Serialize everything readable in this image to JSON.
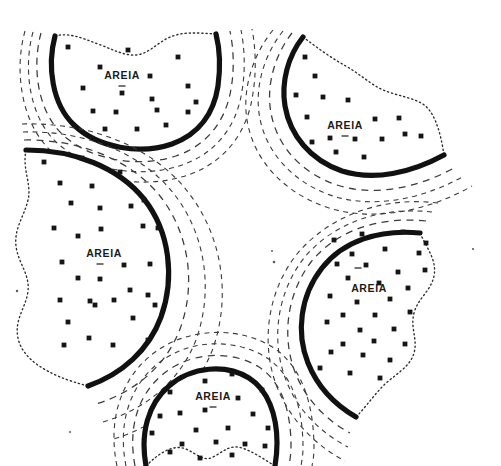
{
  "figure": {
    "width": 501,
    "height": 466,
    "background_color": "#ffffff",
    "line_color": "#111111",
    "dash_color": "#3a3a3a",
    "stipple_color": "#151515",
    "label_color": "#1a1a1a"
  },
  "legend_terms": {
    "sand_label": "AREIA"
  },
  "sand_bodies": [
    {
      "id": "sand-body-top-left",
      "label": "AREIA",
      "label_x": 122,
      "label_y": 76,
      "tick_x": 122,
      "tick_y": 86,
      "outline": "M 55,36 C 47,66 52,104 74,125 C 98,148 140,155 172,144 C 200,134 214,112 218,86 C 221,64 219,46 216,34",
      "dotted": "M 55,36 C 70,32 84,39 98,44 C 112,49 124,56 136,55 C 148,54 156,44 168,38 C 182,31 198,33 216,34",
      "contours": [
        "M 41,33 C 32,66 37,110 62,134 C 90,161 140,168 176,156 C 208,145 226,120 231,89 C 235,66 233,46 230,31",
        "M 33,32 C 23,68 29,116 56,142 C 87,171 142,179 182,165 C 217,153 237,125 242,91 C 246,67 244,45 241,30",
        "M 25,31 C 14,70 21,122 50,150 C 84,181 144,190 188,175 C 226,162 248,131 253,93 C 257,68 255,44 252,29"
      ],
      "stipple": [
        [
          68,
          47
        ],
        [
          128,
          50
        ],
        [
          150,
          76
        ],
        [
          178,
          57
        ],
        [
          188,
          86
        ],
        [
          100,
          67
        ],
        [
          122,
          93
        ],
        [
          152,
          99
        ],
        [
          188,
          112
        ],
        [
          93,
          111
        ],
        [
          116,
          112
        ],
        [
          157,
          110
        ],
        [
          83,
          88
        ],
        [
          166,
          125
        ],
        [
          137,
          129
        ],
        [
          105,
          129
        ],
        [
          196,
          102
        ]
      ]
    },
    {
      "id": "sand-body-top-right",
      "label": "AREIA",
      "label_x": 345,
      "label_y": 126,
      "tick_x": 345,
      "tick_y": 136,
      "outline": "M 303,37 C 288,56 281,82 285,106 C 290,135 310,160 342,171 C 374,181 411,173 444,155",
      "dotted": "M 303,37 C 316,47 330,57 344,65 C 357,72 368,82 379,88 C 392,95 408,96 421,103 C 433,109 440,128 444,155",
      "contours": [
        "M 292,33 C 274,56 266,87 271,113 C 277,146 301,173 337,185 C 374,197 418,188 456,167",
        "M 283,31 C 263,56 254,90 260,119 C 267,154 294,183 333,196 C 374,209 423,199 464,176",
        "M 273,30 C 251,57 241,94 248,125 C 256,163 286,194 329,208 C 374,222 428,211 472,186"
      ],
      "stipple": [
        [
          305,
          57
        ],
        [
          315,
          76
        ],
        [
          296,
          95
        ],
        [
          323,
          97
        ],
        [
          348,
          100
        ],
        [
          307,
          117
        ],
        [
          375,
          119
        ],
        [
          399,
          118
        ],
        [
          330,
          138
        ],
        [
          355,
          139
        ],
        [
          382,
          139
        ],
        [
          405,
          134
        ],
        [
          336,
          152
        ],
        [
          312,
          142
        ],
        [
          364,
          157
        ],
        [
          421,
          136
        ]
      ]
    },
    {
      "id": "sand-body-left",
      "label": "AREIA",
      "label_x": 104,
      "label_y": 254,
      "tick_x": 100,
      "tick_y": 264,
      "outline": "M 26,150 C 74,150 118,167 144,199 C 170,232 175,278 161,317 C 149,350 122,374 88,386",
      "dotted": "M 26,150 C 22,170 32,184 28,200 C 24,217 14,228 16,246 C 18,263 30,274 28,291 C 26,308 14,319 18,338 C 22,358 45,375 88,386",
      "contours": [
        "M 24,140 C 80,139 131,160 160,196 C 190,234 196,286 180,329 C 166,366 135,392 96,404",
        "M 23,132 C 86,130 143,154 174,194 C 207,236 213,293 196,340 C 180,381 146,409 103,422",
        "M 22,124 C 92,122 154,148 188,192 C 224,238 231,300 212,351 C 194,396 157,427 110,440"
      ],
      "stipple": [
        [
          44,
          162
        ],
        [
          82,
          158
        ],
        [
          120,
          172
        ],
        [
          60,
          183
        ],
        [
          92,
          186
        ],
        [
          144,
          200
        ],
        [
          71,
          203
        ],
        [
          100,
          208
        ],
        [
          131,
          206
        ],
        [
          54,
          228
        ],
        [
          101,
          229
        ],
        [
          143,
          226
        ],
        [
          78,
          236
        ],
        [
          158,
          228
        ],
        [
          62,
          262
        ],
        [
          150,
          264
        ],
        [
          78,
          278
        ],
        [
          124,
          265
        ],
        [
          100,
          279
        ],
        [
          60,
          300
        ],
        [
          130,
          290
        ],
        [
          148,
          295
        ],
        [
          90,
          301
        ],
        [
          95,
          305
        ],
        [
          114,
          300
        ],
        [
          68,
          322
        ],
        [
          133,
          318
        ],
        [
          89,
          338
        ],
        [
          113,
          345
        ],
        [
          64,
          345
        ],
        [
          155,
          305
        ],
        [
          148,
          340
        ]
      ]
    },
    {
      "id": "sand-body-bottom-right",
      "label": "AREIA",
      "label_x": 369,
      "label_y": 289,
      "tick_x": 358,
      "tick_y": 268,
      "outline": "M 420,233 C 379,229 343,241 322,268 C 300,296 296,333 308,363 C 318,388 337,406 356,417",
      "dotted": "M 420,233 C 428,250 437,261 434,276 C 431,291 418,298 414,313 C 410,328 418,339 414,353 C 410,368 392,376 381,388 C 371,399 364,409 356,417",
      "contours": [
        "M 426,221 C 378,216 336,231 311,262 C 286,295 282,338 295,372 C 306,401 328,421 350,433",
        "M 432,212 C 379,206 332,224 304,258 C 276,294 271,342 286,380 C 298,412 323,434 348,447",
        "M 438,203 C 380,196 328,217 297,254 C 266,293 261,346 277,387 C 291,422 318,447 345,461"
      ],
      "stipple": [
        [
          334,
          240
        ],
        [
          362,
          234
        ],
        [
          403,
          232
        ],
        [
          426,
          243
        ],
        [
          352,
          254
        ],
        [
          385,
          249
        ],
        [
          419,
          253
        ],
        [
          337,
          264
        ],
        [
          366,
          265
        ],
        [
          398,
          272
        ],
        [
          425,
          270
        ],
        [
          348,
          278
        ],
        [
          379,
          283
        ],
        [
          408,
          288
        ],
        [
          330,
          296
        ],
        [
          357,
          302
        ],
        [
          390,
          299
        ],
        [
          343,
          315
        ],
        [
          375,
          315
        ],
        [
          410,
          312
        ],
        [
          327,
          322
        ],
        [
          360,
          330
        ],
        [
          394,
          329
        ],
        [
          343,
          344
        ],
        [
          374,
          341
        ],
        [
          405,
          344
        ],
        [
          331,
          352
        ],
        [
          363,
          355
        ],
        [
          390,
          360
        ],
        [
          350,
          373
        ],
        [
          320,
          368
        ],
        [
          380,
          378
        ]
      ]
    },
    {
      "id": "sand-body-bottom-center",
      "label": "AREIA",
      "label_x": 213,
      "label_y": 397,
      "tick_x": 213,
      "tick_y": 407,
      "outline": "M 146,466 C 140,433 148,404 169,386 C 192,366 226,364 249,378 C 268,390 277,415 277,443 C 277,452 276,460 275,466",
      "dotted": "M 146,466 C 160,452 174,444 186,449 C 197,454 204,462 213,457 C 223,452 230,444 242,448 C 254,452 265,460 275,466",
      "contours": [
        "M 135,466 C 128,429 137,396 162,375 C 190,351 232,350 259,367 C 282,382 291,412 291,446 C 291,453 290,460 289,466",
        "M 126,466 C 118,426 128,389 156,365 C 188,338 236,338 267,358 C 293,375 303,409 303,448 C 303,454 302,460 301,466",
        "M 117,466 C 108,423 119,382 150,356 C 186,326 240,326 274,348 C 303,368 314,406 314,449 C 314,455 313,461 312,466"
      ],
      "stipple": [
        [
          205,
          381
        ],
        [
          232,
          374
        ],
        [
          170,
          392
        ],
        [
          238,
          398
        ],
        [
          262,
          390
        ],
        [
          180,
          413
        ],
        [
          205,
          410
        ],
        [
          253,
          414
        ],
        [
          160,
          416
        ],
        [
          228,
          428
        ],
        [
          196,
          430
        ],
        [
          268,
          428
        ],
        [
          152,
          433
        ],
        [
          216,
          442
        ],
        [
          245,
          444
        ],
        [
          182,
          444
        ],
        [
          265,
          446
        ],
        [
          170,
          452
        ],
        [
          232,
          455
        ],
        [
          200,
          458
        ]
      ]
    }
  ],
  "specks": [
    {
      "x": 17,
      "y": 291,
      "r": 1.2
    },
    {
      "x": 274,
      "y": 262,
      "r": 1.3
    },
    {
      "x": 272,
      "y": 251,
      "r": 1.0
    },
    {
      "x": 473,
      "y": 249,
      "r": 1.1
    },
    {
      "x": 70,
      "y": 432,
      "r": 1.0
    }
  ]
}
